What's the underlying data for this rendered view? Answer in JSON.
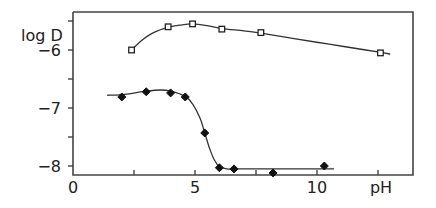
{
  "chart_data": {
    "type": "line",
    "title": "",
    "xlabel": "pH",
    "ylabel": "log D",
    "xlim": [
      0,
      14
    ],
    "ylim": [
      -8.15,
      -5.35
    ],
    "grid": false,
    "legend": "none",
    "x_ticks": [
      0,
      2.5,
      5,
      7.5,
      10,
      12.5
    ],
    "x_tick_labels": [
      {
        "value": 0,
        "label": "0"
      },
      {
        "value": 5,
        "label": "5"
      },
      {
        "value": 10,
        "label": "10"
      },
      {
        "value": 12.5,
        "label": "pH"
      }
    ],
    "y_ticks": [
      -5.5,
      -6,
      -6.5,
      -7,
      -7.5,
      -8
    ],
    "y_tick_labels": [
      {
        "value": -6,
        "label": "-6"
      },
      {
        "value": -7,
        "label": "-7"
      },
      {
        "value": -8,
        "label": "-8"
      }
    ],
    "series": [
      {
        "name": "open squares",
        "marker": "square-open",
        "x": [
          2.4,
          3.9,
          4.9,
          6.1,
          7.7,
          12.6
        ],
        "y": [
          -6.0,
          -5.6,
          -5.55,
          -5.64,
          -5.7,
          -6.05
        ],
        "curve_x": [
          2.4,
          2.8,
          3.3,
          3.9,
          4.4,
          4.9,
          5.5,
          6.1,
          7.0,
          7.7,
          9.0,
          10.5,
          12.0,
          12.6,
          13.0
        ],
        "curve_y": [
          -6.0,
          -5.84,
          -5.7,
          -5.61,
          -5.57,
          -5.55,
          -5.58,
          -5.63,
          -5.67,
          -5.71,
          -5.8,
          -5.9,
          -6.0,
          -6.04,
          -6.07
        ]
      },
      {
        "name": "filled diamonds",
        "marker": "diamond-filled",
        "x": [
          2.0,
          3.0,
          4.0,
          4.6,
          5.4,
          6.0,
          6.6,
          8.2,
          10.3
        ],
        "y": [
          -6.81,
          -6.72,
          -6.74,
          -6.81,
          -7.43,
          -8.03,
          -8.05,
          -8.12,
          -8.0
        ],
        "curve_x": [
          1.4,
          2.0,
          3.0,
          3.6,
          4.0,
          4.6,
          4.9,
          5.2,
          5.4,
          5.6,
          5.8,
          6.0,
          6.3,
          6.6,
          8.0,
          10.7
        ],
        "curve_y": [
          -6.78,
          -6.77,
          -6.71,
          -6.69,
          -6.71,
          -6.8,
          -6.93,
          -7.17,
          -7.43,
          -7.7,
          -7.9,
          -8.01,
          -8.05,
          -8.05,
          -8.05,
          -8.05
        ]
      }
    ]
  }
}
